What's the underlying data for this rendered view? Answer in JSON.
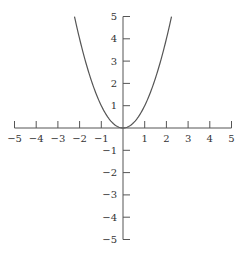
{
  "chart_data": {
    "type": "line",
    "title": "",
    "xlabel": "",
    "ylabel": "",
    "xlim": [
      -5,
      5
    ],
    "ylim": [
      -5,
      5
    ],
    "grid": false,
    "legend": null,
    "x_ticks": [
      -5,
      -4,
      -3,
      -2,
      -1,
      1,
      2,
      3,
      4,
      5
    ],
    "y_ticks": [
      -5,
      -4,
      -3,
      -2,
      -1,
      1,
      2,
      3,
      4,
      5
    ],
    "x_tick_labels": [
      "−5",
      "−4",
      "−3",
      "−2",
      "−1",
      "1",
      "2",
      "3",
      "4",
      "5"
    ],
    "y_tick_labels": [
      "−5",
      "−4",
      "−3",
      "−2",
      "−1",
      "1",
      "2",
      "3",
      "4",
      "5"
    ],
    "series": [
      {
        "name": "y = x^2",
        "function": "x^2",
        "x": [
          -2.236,
          -2,
          -1.5,
          -1,
          -0.5,
          0,
          0.5,
          1,
          1.5,
          2,
          2.236
        ],
        "y": [
          5,
          4,
          2.25,
          1,
          0.25,
          0,
          0.25,
          1,
          2.25,
          4,
          5
        ]
      }
    ]
  },
  "style": {
    "axis_color": "#555555",
    "curve_color": "#555555",
    "background": "#ffffff"
  }
}
